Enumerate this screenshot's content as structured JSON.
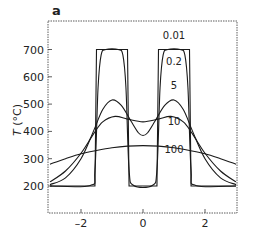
{
  "panel_label": "a",
  "chart_data": {
    "type": "line",
    "title": "",
    "xlabel": "",
    "ylabel": "T (°C)",
    "xlim": [
      -3.1,
      3.1
    ],
    "ylim": [
      100,
      800
    ],
    "grid": false,
    "legend": "inline labels",
    "x_ticks": [
      -2,
      0,
      2
    ],
    "x_tick_labels": [
      "–2",
      "0",
      "2"
    ],
    "y_ticks": [
      200,
      300,
      400,
      500,
      600,
      700
    ],
    "y_tick_labels": [
      "200",
      "300",
      "400",
      "500",
      "600",
      "700"
    ],
    "series": [
      {
        "name": "0.01",
        "label_pos": [
          1.0,
          740
        ],
        "points": [
          [
            -3,
            200
          ],
          [
            -1.55,
            200
          ],
          [
            -1.5,
            700
          ],
          [
            -0.5,
            700
          ],
          [
            -0.45,
            200
          ],
          [
            0.45,
            200
          ],
          [
            0.5,
            700
          ],
          [
            1.5,
            700
          ],
          [
            1.55,
            200
          ],
          [
            3,
            200
          ]
        ]
      },
      {
        "name": "0.2",
        "label_pos": [
          1.0,
          645
        ],
        "points": [
          [
            -3,
            200
          ],
          [
            -1.7,
            202
          ],
          [
            -1.55,
            260
          ],
          [
            -1.45,
            560
          ],
          [
            -1.35,
            680
          ],
          [
            -1.2,
            700
          ],
          [
            -0.8,
            700
          ],
          [
            -0.65,
            680
          ],
          [
            -0.55,
            560
          ],
          [
            -0.45,
            260
          ],
          [
            -0.3,
            202
          ],
          [
            0.3,
            202
          ],
          [
            0.45,
            260
          ],
          [
            0.55,
            560
          ],
          [
            0.65,
            680
          ],
          [
            0.8,
            700
          ],
          [
            1.2,
            700
          ],
          [
            1.35,
            680
          ],
          [
            1.45,
            560
          ],
          [
            1.55,
            260
          ],
          [
            1.7,
            202
          ],
          [
            3,
            200
          ]
        ]
      },
      {
        "name": "5",
        "label_pos": [
          1.0,
          555
        ],
        "points": [
          [
            -3,
            205
          ],
          [
            -2.5,
            230
          ],
          [
            -2,
            300
          ],
          [
            -1.6,
            400
          ],
          [
            -1.3,
            480
          ],
          [
            -1.0,
            515
          ],
          [
            -0.7,
            495
          ],
          [
            -0.4,
            440
          ],
          [
            -0.15,
            395
          ],
          [
            0,
            385
          ],
          [
            0.15,
            395
          ],
          [
            0.4,
            440
          ],
          [
            0.7,
            495
          ],
          [
            1.0,
            515
          ],
          [
            1.3,
            480
          ],
          [
            1.6,
            400
          ],
          [
            2,
            300
          ],
          [
            2.5,
            230
          ],
          [
            3,
            205
          ]
        ]
      },
      {
        "name": "10",
        "label_pos": [
          1.0,
          425
        ],
        "points": [
          [
            -3,
            215
          ],
          [
            -2.5,
            255
          ],
          [
            -2,
            320
          ],
          [
            -1.6,
            390
          ],
          [
            -1.3,
            435
          ],
          [
            -0.9,
            455
          ],
          [
            -0.5,
            445
          ],
          [
            0,
            435
          ],
          [
            0.5,
            445
          ],
          [
            0.9,
            455
          ],
          [
            1.3,
            435
          ],
          [
            1.6,
            390
          ],
          [
            2,
            320
          ],
          [
            2.5,
            255
          ],
          [
            3,
            215
          ]
        ]
      },
      {
        "name": "100",
        "label_pos": [
          1.0,
          320
        ],
        "points": [
          [
            -3,
            280
          ],
          [
            -2.5,
            300
          ],
          [
            -2,
            318
          ],
          [
            -1.5,
            330
          ],
          [
            -1,
            340
          ],
          [
            -0.5,
            346
          ],
          [
            0,
            348
          ],
          [
            0.5,
            346
          ],
          [
            1,
            340
          ],
          [
            1.5,
            330
          ],
          [
            2,
            318
          ],
          [
            2.5,
            300
          ],
          [
            3,
            280
          ]
        ]
      }
    ]
  }
}
